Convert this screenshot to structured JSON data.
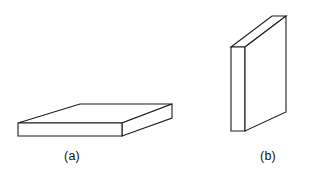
{
  "figure": {
    "background_color": "#ffffff",
    "stroke_color": "#1c1c1c",
    "face_fill_color": "#ffffff",
    "canvas": {
      "width": 309,
      "height": 176
    },
    "shapes": [
      {
        "id": "shape-a",
        "caption": "(a)",
        "description": "horizontal flat rectangular slab in oblique projection",
        "faces": {
          "top": "80,104 172,104 122,123 18,123",
          "front": "18,123 122,123 122,136 18,136",
          "right_side": "122,123 172,104 172,118 122,136"
        }
      },
      {
        "id": "shape-b",
        "caption": "(b)",
        "description": "upright thin rectangular slab in oblique projection",
        "faces": {
          "top": "231,47 286,16 286,16 245,47",
          "left_side": "231,47 245,47 245,131 231,131",
          "front": "245,47 286,16 286,112 245,131"
        }
      }
    ],
    "captions": {
      "a": "(a)",
      "b": "(b)"
    }
  }
}
